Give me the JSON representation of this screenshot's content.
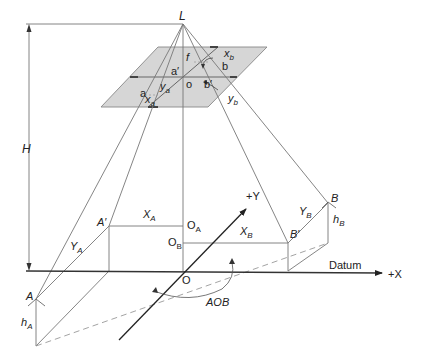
{
  "diagram": {
    "type": "aerial-photo-geometry",
    "colors": {
      "line": "#777777",
      "axis": "#222222",
      "plane_fill": "#d6d6d6",
      "plane_stroke": "#888888",
      "plane_edge_highlight": "#555555",
      "dashed": "#999999"
    },
    "labels": {
      "L": "L",
      "H": "H",
      "f": "f",
      "o": "o",
      "a_prime": "a′",
      "b_prime": "b′",
      "a": "a",
      "b": "b",
      "x_a_base": "x",
      "x_a_sub": "a",
      "y_a_base": "y",
      "y_a_sub": "a",
      "x_b_base": "x",
      "x_b_sub": "b",
      "y_b_base": "y",
      "y_b_sub": "b",
      "A": "A",
      "A_prime": "A′",
      "B": "B",
      "B_prime": "B′",
      "O": "O",
      "O_A_base": "O",
      "O_A_sub": "A",
      "O_B_base": "O",
      "O_B_sub": "B",
      "X_A_base": "X",
      "X_A_sub": "A",
      "X_B_base": "X",
      "X_B_sub": "B",
      "Y_A_base": "Y",
      "Y_A_sub": "A",
      "Y_B_base": "Y",
      "Y_B_sub": "B",
      "h_A_base": "h",
      "h_A_sub": "A",
      "h_B_base": "h",
      "h_B_sub": "B",
      "plus_Y": "+Y",
      "plus_X": "+X",
      "datum": "Datum",
      "AOB": "AOB"
    }
  }
}
